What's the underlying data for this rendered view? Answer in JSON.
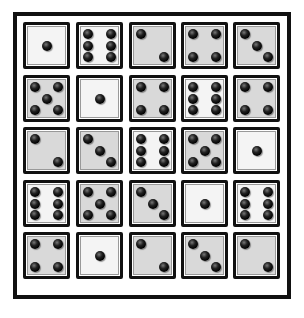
{
  "puzzle": {
    "title": "",
    "grid": {
      "rows": 5,
      "cols": 5,
      "dice": [
        [
          {
            "value": 1,
            "shade": "white"
          },
          {
            "value": 6,
            "shade": "white"
          },
          {
            "value": 2,
            "shade": "gray"
          },
          {
            "value": 4,
            "shade": "gray"
          },
          {
            "value": 3,
            "shade": "gray"
          }
        ],
        [
          {
            "value": 5,
            "shade": "gray"
          },
          {
            "value": 1,
            "shade": "white"
          },
          {
            "value": 4,
            "shade": "gray"
          },
          {
            "value": 6,
            "shade": "white"
          },
          {
            "value": 4,
            "shade": "gray"
          }
        ],
        [
          {
            "value": 2,
            "shade": "gray"
          },
          {
            "value": 3,
            "shade": "gray"
          },
          {
            "value": 6,
            "shade": "white"
          },
          {
            "value": 5,
            "shade": "gray"
          },
          {
            "value": 1,
            "shade": "white"
          }
        ],
        [
          {
            "value": 6,
            "shade": "white"
          },
          {
            "value": 5,
            "shade": "gray"
          },
          {
            "value": 3,
            "shade": "gray"
          },
          {
            "value": 1,
            "shade": "white"
          },
          {
            "value": 6,
            "shade": "white"
          }
        ],
        [
          {
            "value": 4,
            "shade": "gray"
          },
          {
            "value": 1,
            "shade": "white"
          },
          {
            "value": 2,
            "shade": "gray"
          },
          {
            "value": 3,
            "shade": "gray"
          },
          {
            "value": 2,
            "shade": "gray"
          }
        ]
      ]
    },
    "colors": {
      "frame": "#111111",
      "die_white": "#f4f4f4",
      "die_gray": "#d9d9d9",
      "pip": "#000000"
    }
  }
}
